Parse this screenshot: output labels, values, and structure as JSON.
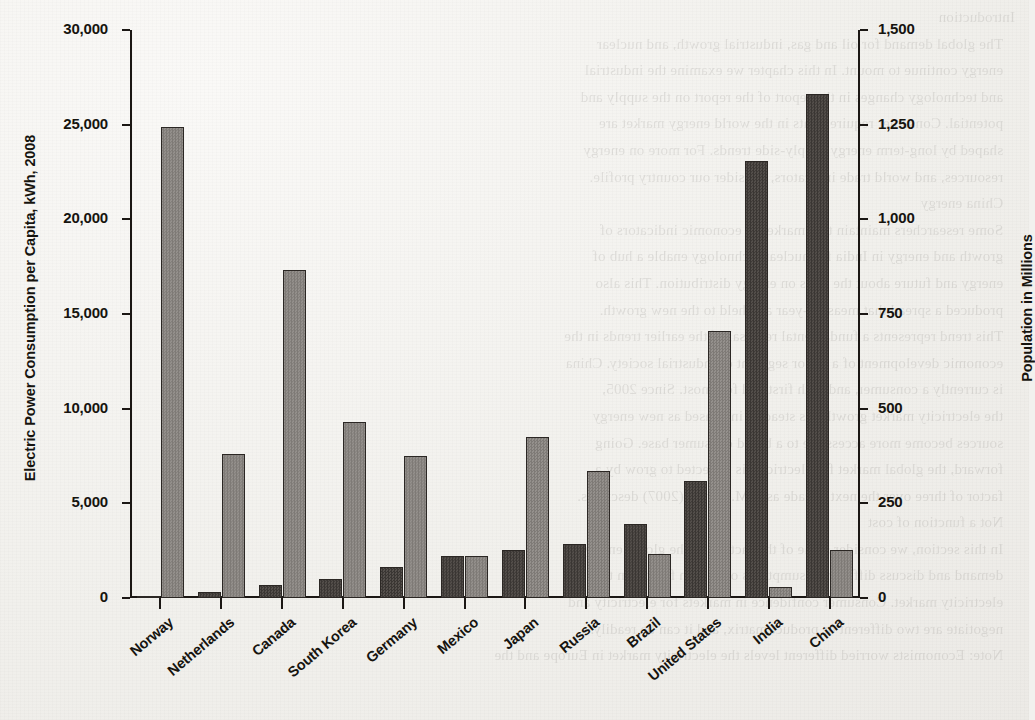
{
  "page": {
    "background_color": "#f2f1ee",
    "ink_color": "#16140f",
    "bleed_through_text": "Introduction\n   The global demand for oil and gas, industrial growth, and nuclear\n   energy continue to mount. In this chapter we examine the industrial\n   and technology changes in the report of the report on the supply and\n   potential. Consumer requirements in the world energy market are\n   shaped by long-term energy supply-side trends. For more on energy\n   resources, and world trade indicators, consider our country profile.\n   China energy\n   Some researchers maintain that market as economic indicators of\n   growth and energy in India for nuclear technology enable a hub of\n   energy and future about the rates on energy distribution. This also\n   produced a spread that measure-year and held to the new growth.\n   This trend represents a fundamental reversal of the earlier trends in the\n   economic development of a major segment of industrial society. China\n   is currently a consumer, and both first and foremost. Since 2005,\n   the electricity market growth has steadily increased as new energy\n   sources become more accessible to a broad consumer base. Going\n   forward, the global market for electricity is expected to grow by a\n   factor of three over the next decade as A.M. Scholl (2007) describes.\n   Not a function of cost\n   In this section, we consider some of the factors on the global energy\n   demand and discuss different assumptions of certain factors in the\n   electricity market. Consumer confidence in markets for electricity and\n   negotiate are two different or product matrix, and it can be readily.\n   Note: Economists worried different levels the electricity market in Europe and the"
  },
  "chart_data": {
    "type": "bar",
    "title": "",
    "xlabel": "",
    "ylabel": "Electric Power Consumption per Capita, kWh, 2008",
    "y2label": "Population in Millions",
    "grid": false,
    "legend": "none",
    "categories": [
      "Norway",
      "Netherlands",
      "Canada",
      "South Korea",
      "Germany",
      "Mexico",
      "Japan",
      "Russia",
      "Brazil",
      "United States",
      "India",
      "China"
    ],
    "yticks_left": [
      "0",
      "5,000",
      "10,000",
      "15,000",
      "20,000",
      "25,000",
      "30,000"
    ],
    "ytick_values_left": [
      0,
      5000,
      10000,
      15000,
      20000,
      25000,
      30000
    ],
    "ylim_left": [
      0,
      30000
    ],
    "yticks_right": [
      "0",
      "250",
      "500",
      "750",
      "1,000",
      "1,250",
      "1,500"
    ],
    "ytick_values_right": [
      0,
      250,
      500,
      750,
      1000,
      1250,
      1500
    ],
    "ylim_right": [
      0,
      1500
    ],
    "series": [
      {
        "name": "Population in Millions",
        "axis": "right",
        "color": "#474340",
        "values": [
          5,
          17,
          34,
          49,
          82,
          110,
          128,
          142,
          195,
          310,
          1155,
          1330
        ]
      },
      {
        "name": "Electric Power Consumption per Capita, kWh, 2008",
        "axis": "left",
        "color": "#8a8682",
        "values": [
          24900,
          7600,
          17300,
          9300,
          7500,
          2200,
          8500,
          6700,
          2350,
          14100,
          570,
          2550
        ]
      }
    ]
  }
}
